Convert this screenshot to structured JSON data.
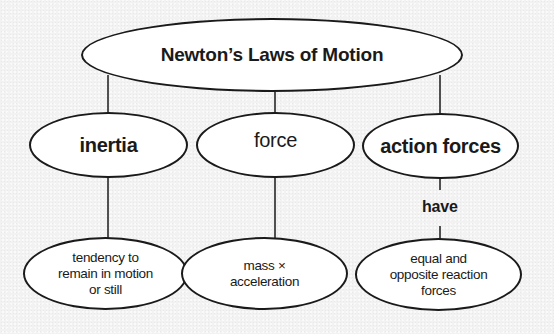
{
  "diagram": {
    "type": "concept-map",
    "root": {
      "label": "Newton’s Laws of Motion"
    },
    "branches": [
      {
        "label": "inertia",
        "child": {
          "label": "tendency to\nremain in motion\nor still"
        }
      },
      {
        "label": "force",
        "child": {
          "label": "mass ×\nacceleration"
        }
      },
      {
        "label": "action forces",
        "link_label": "have",
        "child": {
          "label": "equal and\nopposite reaction\nforces"
        }
      }
    ],
    "colors": {
      "stroke": "#1a1a1a",
      "node_fill": "#ffffff",
      "background": "#f2f2f2"
    }
  }
}
